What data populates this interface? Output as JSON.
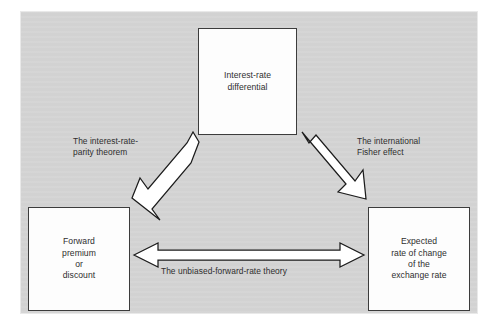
{
  "figure": {
    "title_fragment": "",
    "panel_color": "#d4d4d4",
    "box_fill": "#fdfdfd",
    "box_border_color": "#3c3c3c",
    "text_color": "#2e2e2e",
    "arrow_fill": "#ffffff",
    "arrow_stroke": "#1c1c1c"
  },
  "nodes": [
    {
      "id": "interest-rate-differential",
      "label": "Interest-rate\ndifferential"
    },
    {
      "id": "forward-premium-or-discount",
      "label": "Forward\npremium\nor\ndiscount"
    },
    {
      "id": "expected-rate-of-change-of-the-exchange-rate",
      "label": "Expected\nrate of change\nof the\nexchange rate"
    }
  ],
  "edges": [
    {
      "id": "interest-rate-parity-theorem",
      "label": "The interest-rate-\nparity theorem",
      "from": "forward-premium-or-discount",
      "to": "interest-rate-differential",
      "direction": "bidirectional"
    },
    {
      "id": "international-fisher-effect",
      "label": "The international\nFisher effect",
      "from": "interest-rate-differential",
      "to": "expected-rate-of-change-of-the-exchange-rate",
      "direction": "bidirectional"
    },
    {
      "id": "unbiased-forward-rate-theory",
      "label": "The unbiased-forward-rate theory",
      "from": "forward-premium-or-discount",
      "to": "expected-rate-of-change-of-the-exchange-rate",
      "direction": "bidirectional"
    }
  ]
}
